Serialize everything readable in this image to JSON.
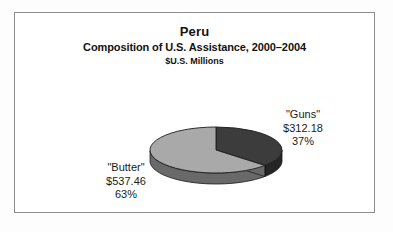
{
  "figure": {
    "title": "Peru",
    "subtitle": "Composition of U.S. Assistance, 2000–2004",
    "units": "$U.S. Millions",
    "frame_color": "#8d8d8d",
    "background": "#ffffff"
  },
  "labels": {
    "guns": {
      "name": "\"Guns\"",
      "value": "$312.18",
      "percent": "37%"
    },
    "butter": {
      "name": "\"Butter\"",
      "value": "$537.46",
      "percent": "63%"
    }
  },
  "chart_data": {
    "type": "pie",
    "title": "Peru",
    "subtitle": "Composition of U.S. Assistance, 2000–2004",
    "ylabel": "$U.S. Millions",
    "xlabel": "",
    "three_d": true,
    "start_angle_deg": 0,
    "direction": "clockwise",
    "grid": false,
    "legend": "none (direct callout labels)",
    "total": 849.64,
    "categories": [
      "\"Guns\"",
      "\"Butter\""
    ],
    "values": [
      312.18,
      537.46
    ],
    "percents": [
      37,
      63
    ],
    "colors": [
      "#3c3c3c",
      "#a9a9a9"
    ],
    "slices": [
      {
        "label": "\"Guns\"",
        "value": 312.18,
        "percent": 37,
        "color": "#3c3c3c",
        "label_position": "right"
      },
      {
        "label": "\"Butter\"",
        "value": 537.46,
        "percent": 63,
        "color": "#a9a9a9",
        "label_position": "left"
      }
    ]
  }
}
